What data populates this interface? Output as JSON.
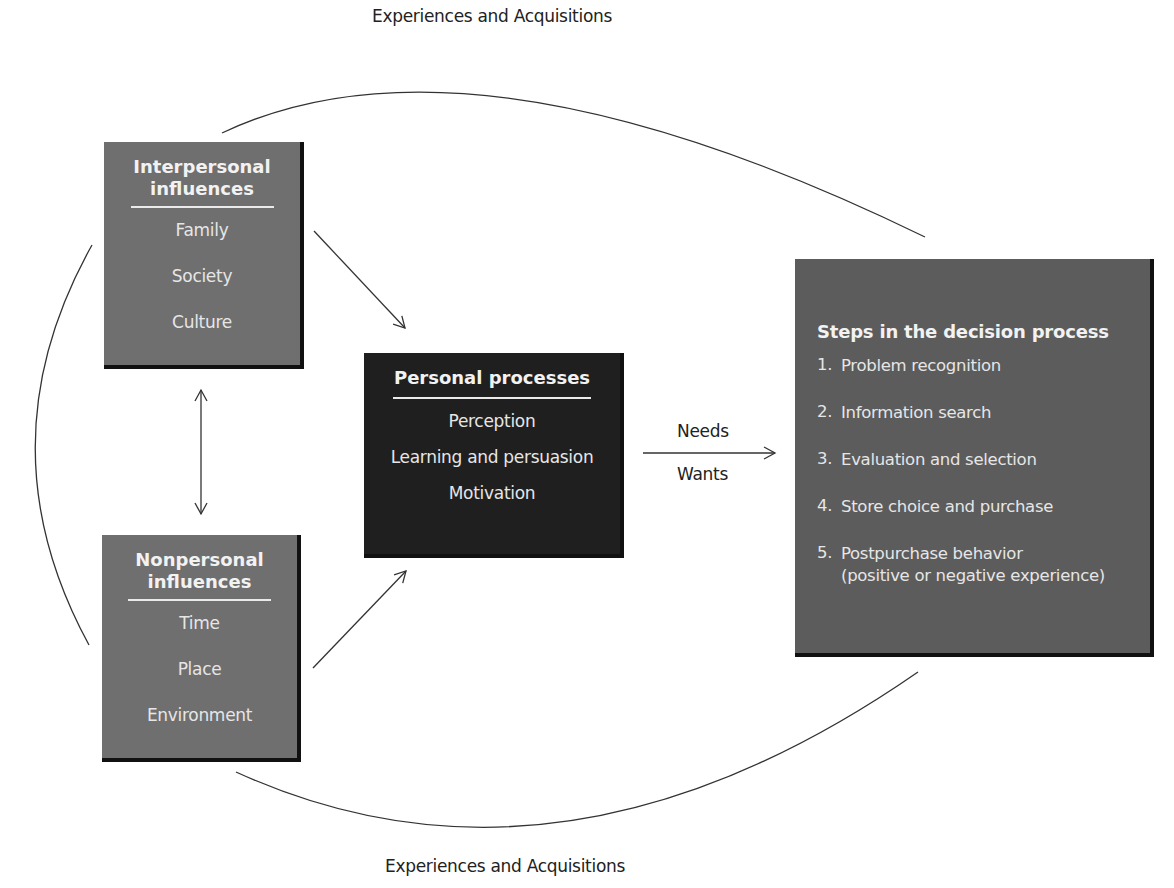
{
  "captions": {
    "top": "Experiences and Acquisitions",
    "bottom": "Experiences and Acquisitions",
    "needs": "Needs",
    "wants": "Wants"
  },
  "interpersonal": {
    "title_line1": "Interpersonal",
    "title_line2": "influences",
    "items": [
      "Family",
      "Society",
      "Culture"
    ]
  },
  "nonpersonal": {
    "title_line1": "Nonpersonal",
    "title_line2": "influences",
    "items": [
      "Time",
      "Place",
      "Environment"
    ]
  },
  "personal": {
    "title": "Personal processes",
    "items": [
      "Perception",
      "Learning and persuasion",
      "Motivation"
    ]
  },
  "decision": {
    "title": "Steps in the decision process",
    "steps": [
      {
        "num": "1.",
        "text": "Problem recognition"
      },
      {
        "num": "2.",
        "text": "Information search"
      },
      {
        "num": "3.",
        "text": "Evaluation and selection"
      },
      {
        "num": "4.",
        "text": "Store choice and purchase"
      },
      {
        "num": "5.",
        "text": "Postpurchase behavior",
        "text2": "(positive or negative experience)"
      }
    ]
  },
  "colors": {
    "influence_box": "#6f6f6f",
    "personal_box": "#1f1f1f",
    "decision_box": "#5c5c5c",
    "line": "#333333"
  }
}
